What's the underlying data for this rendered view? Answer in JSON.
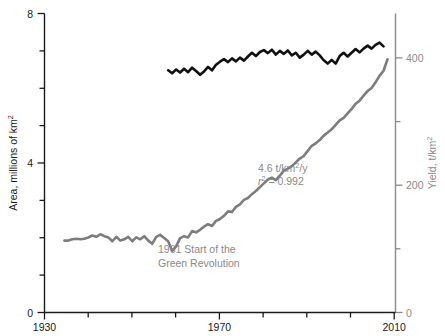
{
  "chart_data": {
    "type": "line",
    "title": "",
    "subtitle": "",
    "xlabel": "",
    "xlim": [
      1930,
      2018
    ],
    "x_ticks_major": [
      1930,
      1970,
      2010
    ],
    "x_ticks_minor": [
      1940,
      1950,
      1960,
      1980,
      1990,
      2000
    ],
    "grid": false,
    "legend_position": "none",
    "axes": [
      {
        "id": "left",
        "label": "Area, millions of km",
        "label_sup": "2",
        "ylim": [
          0,
          8
        ],
        "ticks_major": [
          0,
          4,
          8
        ],
        "ticks_minor": [
          1,
          2,
          3,
          5,
          6,
          7
        ],
        "tick_labels": [
          "0",
          "4",
          "8"
        ],
        "color": "#1a1a1a"
      },
      {
        "id": "right",
        "label": "Yield, t/km",
        "label_sup": "2",
        "ylim": [
          0,
          470
        ],
        "ticks_major": [
          0,
          200,
          400
        ],
        "ticks_minor": [
          100,
          300
        ],
        "tick_labels": [
          "0",
          "200",
          "400"
        ],
        "color": "#8a8a8a"
      }
    ],
    "series": [
      {
        "name": "Cereal harvested area",
        "axis": "left",
        "units": "millions of km2",
        "color": "#111111",
        "x_start": 1961,
        "x_end": 2015,
        "x": [
          1961,
          1962,
          1963,
          1964,
          1965,
          1966,
          1967,
          1968,
          1969,
          1970,
          1971,
          1972,
          1973,
          1974,
          1975,
          1976,
          1977,
          1978,
          1979,
          1980,
          1981,
          1982,
          1983,
          1984,
          1985,
          1986,
          1987,
          1988,
          1989,
          1990,
          1991,
          1992,
          1993,
          1994,
          1995,
          1996,
          1997,
          1998,
          1999,
          2000,
          2001,
          2002,
          2003,
          2004,
          2005,
          2006,
          2007,
          2008,
          2009,
          2010,
          2011,
          2012,
          2013,
          2014,
          2015
        ],
        "values": [
          6.48,
          6.4,
          6.5,
          6.42,
          6.52,
          6.43,
          6.55,
          6.46,
          6.36,
          6.45,
          6.57,
          6.48,
          6.63,
          6.71,
          6.78,
          6.7,
          6.8,
          6.72,
          6.82,
          6.74,
          6.85,
          6.95,
          6.86,
          6.97,
          7.02,
          6.94,
          7.03,
          6.9,
          7.0,
          6.92,
          7.01,
          6.88,
          6.95,
          6.82,
          6.9,
          7.0,
          6.9,
          6.98,
          6.88,
          6.75,
          6.66,
          6.76,
          6.66,
          6.86,
          6.95,
          6.85,
          6.95,
          7.05,
          6.96,
          7.06,
          7.14,
          7.06,
          7.16,
          7.22,
          7.12
        ]
      },
      {
        "name": "Cereal yield",
        "axis": "right",
        "units": "t/km2",
        "color": "#7d7d7d",
        "x_start": 1935,
        "x_end": 2016,
        "x": [
          1935,
          1936,
          1937,
          1938,
          1939,
          1940,
          1941,
          1942,
          1943,
          1944,
          1945,
          1946,
          1947,
          1948,
          1949,
          1950,
          1951,
          1952,
          1953,
          1954,
          1955,
          1956,
          1957,
          1958,
          1959,
          1960,
          1961,
          1962,
          1963,
          1964,
          1965,
          1966,
          1967,
          1968,
          1969,
          1970,
          1971,
          1972,
          1973,
          1974,
          1975,
          1976,
          1977,
          1978,
          1979,
          1980,
          1981,
          1982,
          1983,
          1984,
          1985,
          1986,
          1987,
          1988,
          1989,
          1990,
          1991,
          1992,
          1993,
          1994,
          1995,
          1996,
          1997,
          1998,
          1999,
          2000,
          2001,
          2002,
          2003,
          2004,
          2005,
          2006,
          2007,
          2008,
          2009,
          2010,
          2011,
          2012,
          2013,
          2014,
          2015,
          2016
        ],
        "values": [
          113,
          113,
          115,
          116,
          115,
          116,
          118,
          121,
          119,
          123,
          120,
          118,
          112,
          119,
          113,
          115,
          119,
          112,
          118,
          115,
          120,
          113,
          108,
          119,
          122,
          117,
          112,
          97,
          104,
          117,
          120,
          118,
          128,
          126,
          130,
          135,
          139,
          136,
          144,
          147,
          152,
          159,
          158,
          166,
          170,
          177,
          180,
          186,
          191,
          197,
          203,
          209,
          212,
          208,
          215,
          223,
          226,
          230,
          236,
          242,
          246,
          254,
          262,
          266,
          271,
          278,
          283,
          288,
          295,
          302,
          306,
          313,
          320,
          328,
          333,
          341,
          348,
          353,
          362,
          372,
          380,
          398
        ],
        "trend_label": "4.6 t/km2/y",
        "r_squared": "0.992"
      }
    ],
    "annotations": [
      {
        "id": "trend-rate",
        "text_main": "4.6 t/km",
        "text_sup": "2",
        "text_tail": "/y",
        "x": 1994,
        "y_left_axis": 3.6,
        "color": "#8a8a8a"
      },
      {
        "id": "r-squared",
        "text_italic": "r",
        "text_sup": "2",
        "text_tail": " = 0.992",
        "x": 1994,
        "y_left_axis": 3.25,
        "color": "#8a8a8a"
      },
      {
        "id": "green-revolution",
        "line1": "1961 Start of the",
        "line2": "Green Revolution",
        "x": 1963,
        "y_left_axis": 1.55,
        "color": "#8a8a8a"
      }
    ]
  },
  "axis_left": {
    "title_main": "Area, millions of km",
    "title_sup": "2",
    "tick_0": "0",
    "tick_4": "4",
    "tick_8": "8"
  },
  "axis_right": {
    "title_main": "Yield, t/km",
    "title_sup": "2",
    "tick_0": "0",
    "tick_200": "200",
    "tick_400": "400"
  },
  "axis_x": {
    "tick_1930": "1930",
    "tick_1970": "1970",
    "tick_2010": "2010"
  },
  "annotation_trend": {
    "main": "4.6 t/km",
    "sup": "2",
    "tail": "/y"
  },
  "annotation_r2": {
    "var": "r",
    "sup": "2",
    "tail": " = 0.992"
  },
  "annotation_green": {
    "line1": "1961 Start of the",
    "line2": "Green Revolution"
  }
}
